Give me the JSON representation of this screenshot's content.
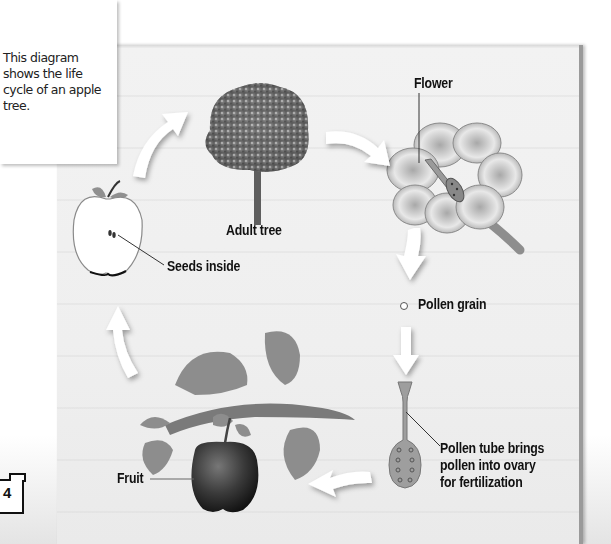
{
  "caption": {
    "text": "This diagram shows the life cycle of an apple tree."
  },
  "labels": {
    "adult_tree": "Adult tree",
    "flower": "Flower",
    "pollen_grain": "Pollen grain",
    "pollen_tube": "Pollen tube brings\npollen into ovary\nfor fertilization",
    "fruit": "Fruit",
    "seeds": "Seeds inside"
  },
  "cycle_order": [
    "Adult tree",
    "Flower",
    "Pollen grain",
    "Pollen tube brings pollen into ovary for fertilization",
    "Fruit",
    "Seeds inside"
  ],
  "page_number": "4",
  "colors": {
    "panel_bg": "#efefef",
    "label_text": "#111111",
    "leaf_gray": "#8f8f8f",
    "arrow_fill": "#ffffff"
  }
}
